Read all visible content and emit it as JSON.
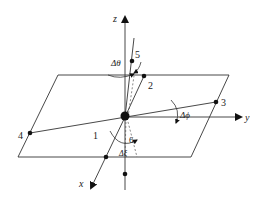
{
  "diagram": {
    "type": "3d-coordinate-plane-angles",
    "axes": {
      "x": {
        "label": "x"
      },
      "y": {
        "label": "y"
      },
      "z": {
        "label": "z"
      }
    },
    "points": [
      {
        "id": "1",
        "label": "1"
      },
      {
        "id": "2",
        "label": "2"
      },
      {
        "id": "3",
        "label": "3"
      },
      {
        "id": "4",
        "label": "4"
      },
      {
        "id": "5",
        "label": "5"
      },
      {
        "id": "6",
        "label": "6"
      }
    ],
    "angles": {
      "theta": "Δθ",
      "phi": "Δϕ",
      "xi": "Δξ"
    },
    "colors": {
      "line": "#333333",
      "point": "#111111",
      "background": "#ffffff"
    }
  }
}
